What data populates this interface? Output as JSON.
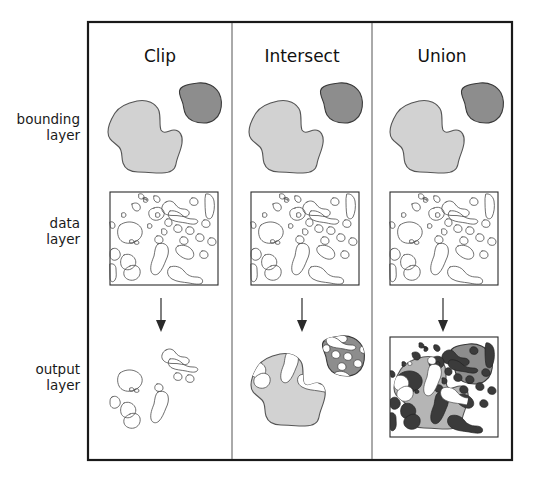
{
  "figure": {
    "type": "diagram",
    "frame": {
      "x": 88,
      "y": 22,
      "width": 424,
      "height": 438,
      "stroke": "#1a1a1a",
      "stroke_width": 2.2
    },
    "dividers": [
      232,
      372
    ],
    "background": "#ffffff"
  },
  "colors": {
    "light_blob_fill": "#d2d2d2",
    "light_blob_stroke": "#555555",
    "dark_blob_fill": "#8d8d8d",
    "dark_blob_stroke": "#3a3a3a",
    "data_line": "#4a4a4a",
    "data_fill_dark": "#3b3b3b",
    "frame_stroke": "#1a1a1a",
    "divider_stroke": "#555555",
    "text": "#111111",
    "page_background": "#ffffff"
  },
  "columns": [
    {
      "id": "clip",
      "label": "Clip",
      "center_x": 160
    },
    {
      "id": "intersect",
      "label": "Intersect",
      "center_x": 302
    },
    {
      "id": "union",
      "label": "Union",
      "center_x": 442
    }
  ],
  "rows": [
    {
      "id": "bounding",
      "line1": "bounding",
      "line2": "layer",
      "label": "bounding layer",
      "label_y": 128
    },
    {
      "id": "data",
      "line1": "data",
      "line2": "layer",
      "label": "data layer",
      "label_y": 232
    },
    {
      "id": "output",
      "line1": "output",
      "line2": "layer",
      "label": "output layer",
      "label_y": 378
    }
  ],
  "row_label_x": 80,
  "panels": {
    "bounding": {
      "description": "Two bounding polygons: one large light-gray blob at lower-left and one smaller dark-gray blob at upper-right.",
      "shapes": [
        {
          "name": "large-light-blob",
          "fill": "light",
          "bbox": [
            107,
            99,
            76,
            75
          ]
        },
        {
          "name": "small-dark-blob",
          "fill": "dark",
          "bbox": [
            178,
            82,
            44,
            42
          ]
        }
      ]
    },
    "data": {
      "description": "Rectangular map extent containing many small irregular vector polygons drawn as unfilled outlines.",
      "box": {
        "x": 110,
        "y": 192,
        "width": 108,
        "height": 93
      },
      "polygon_count": 34
    },
    "output": {
      "clip": {
        "description": "Only the data polygons that fall inside the bounding shapes remain, drawn as unfilled outlines; bounding shapes themselves are discarded.",
        "has_box": false,
        "shapes_filled": false
      },
      "intersect": {
        "description": "Bounding shapes retained with their original gray fills; data polygons inside them appear as white cut-outs. Area outside the bounding shapes is discarded.",
        "has_box": false,
        "shapes_filled": true
      },
      "union": {
        "description": "Full rectangular extent retained. Both bounding shapes and all data polygons are preserved; data polygons render as dark filled areas over the whole extent.",
        "has_box": true,
        "box": {
          "x": 390,
          "y": 337,
          "width": 108,
          "height": 100
        },
        "shapes_filled": true
      }
    }
  },
  "arrows": [
    {
      "name": "arrow-clip",
      "x": 161,
      "y_start": 298,
      "y_end": 329
    },
    {
      "name": "arrow-intersect",
      "x": 302,
      "y_start": 298,
      "y_end": 329
    },
    {
      "name": "arrow-union",
      "x": 443,
      "y_start": 298,
      "y_end": 329
    }
  ]
}
